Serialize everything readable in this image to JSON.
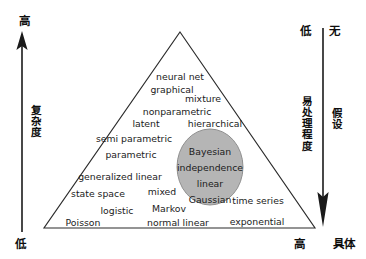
{
  "figure": {
    "type": "diagram",
    "shape": "triangle-with-ellipse",
    "background_color": "#ffffff",
    "line_color": "#2b2b2b",
    "text_color": "#1b1b1b",
    "ellipse_fill": "#b5b5b5",
    "ellipse_stroke": "#8f8f8f"
  },
  "axes": {
    "left": {
      "label": "复杂度",
      "top_end": "高",
      "bottom_end": "低",
      "arrow_direction": "up"
    },
    "right_inner": {
      "label": "易处理程度",
      "top_end": "低",
      "arrow_direction": "down"
    },
    "right_outer": {
      "label": "假设",
      "top_end": "无",
      "bottom_end": "具体"
    },
    "bottom_right": {
      "label": "高"
    }
  },
  "triangle_labels": [
    {
      "text": "neural net",
      "x": 180,
      "y": 72,
      "align": "center"
    },
    {
      "text": "graphical",
      "x": 172,
      "y": 85,
      "align": "center"
    },
    {
      "text": "mixture",
      "x": 203,
      "y": 94,
      "align": "center"
    },
    {
      "text": "nonparametric",
      "x": 177,
      "y": 107,
      "align": "center"
    },
    {
      "text": "latent",
      "x": 146,
      "y": 119,
      "align": "center"
    },
    {
      "text": "hierarchical",
      "x": 215,
      "y": 119,
      "align": "center"
    },
    {
      "text": "semi parametric",
      "x": 134,
      "y": 134,
      "align": "center"
    },
    {
      "text": "parametric",
      "x": 131,
      "y": 150,
      "align": "center"
    },
    {
      "text": "generalized linear",
      "x": 120,
      "y": 172,
      "align": "center"
    },
    {
      "text": "state space",
      "x": 98,
      "y": 189,
      "align": "center"
    },
    {
      "text": "mixed",
      "x": 162,
      "y": 187,
      "align": "center"
    },
    {
      "text": "time series",
      "x": 258,
      "y": 196,
      "align": "center"
    },
    {
      "text": "logistic",
      "x": 117,
      "y": 206,
      "align": "center"
    },
    {
      "text": "Markov",
      "x": 169,
      "y": 204,
      "align": "center"
    },
    {
      "text": "Poisson",
      "x": 83,
      "y": 218,
      "align": "center"
    },
    {
      "text": "normal linear",
      "x": 178,
      "y": 218,
      "align": "center"
    },
    {
      "text": "exponential",
      "x": 257,
      "y": 217,
      "align": "center"
    }
  ],
  "ellipse": {
    "cx": 210,
    "cy": 167,
    "rx": 33,
    "ry": 38,
    "items": [
      {
        "text": "Bayesian",
        "x": 210,
        "y": 147
      },
      {
        "text": "independence",
        "x": 210,
        "y": 163
      },
      {
        "text": "linear",
        "x": 210,
        "y": 179
      },
      {
        "text": "Gaussian",
        "x": 210,
        "y": 195
      }
    ]
  }
}
